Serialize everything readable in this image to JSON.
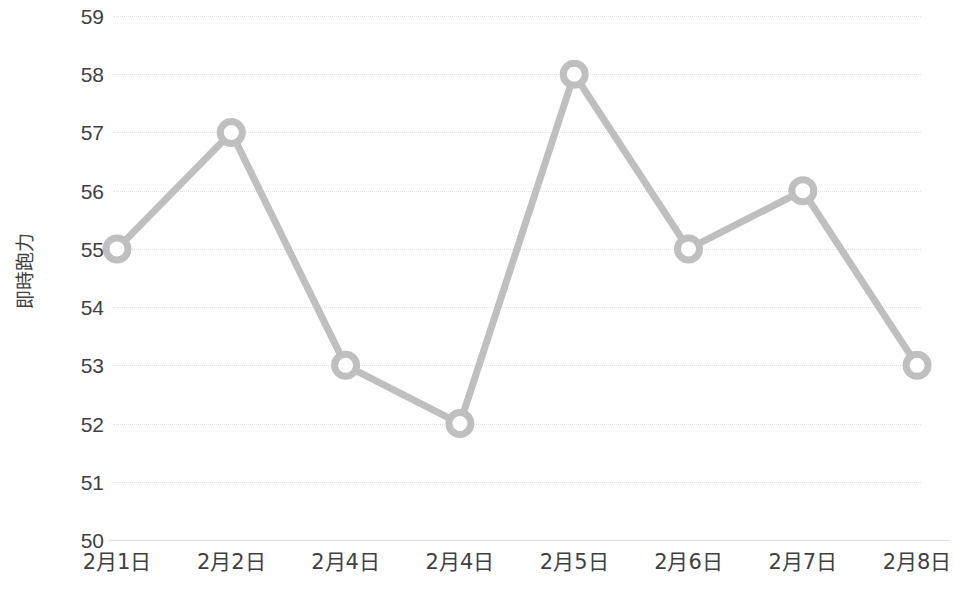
{
  "chart_data": {
    "type": "line",
    "title": "",
    "subtitle": "",
    "xlabel": "",
    "ylabel": "即時跑力",
    "categories": [
      "2月1日",
      "2月2日",
      "2月4日",
      "2月4日",
      "2月5日",
      "2月6日",
      "2月7日",
      "2月8日"
    ],
    "series": [
      {
        "name": "即時跑力",
        "values": [
          55,
          57,
          53,
          52,
          58,
          55,
          56,
          53
        ]
      }
    ],
    "ylim": [
      50,
      59
    ],
    "ytick_labels": [
      "59",
      "58",
      "57",
      "56",
      "55",
      "54",
      "53",
      "52",
      "51",
      "50"
    ],
    "ytick_values": [
      59,
      58,
      57,
      56,
      55,
      54,
      53,
      52,
      51,
      50
    ],
    "grid": true,
    "grid_style": "dotted",
    "legend": false,
    "legend_position": "none",
    "marker": "open-circle",
    "colors": {
      "line": "#bfbfbf",
      "marker_stroke": "#bfbfbf",
      "marker_fill": "#ffffff",
      "gridline": "#e3e3e3",
      "baseline": "#e0e0e0",
      "text": "#3f3f3f",
      "background": "#ffffff"
    }
  }
}
